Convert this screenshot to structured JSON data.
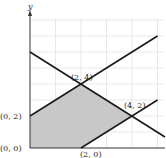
{
  "diagram": {
    "type": "feasible-region-graph",
    "axis": {
      "y_label": "y"
    },
    "x_range": [
      0,
      5.3
    ],
    "y_range": [
      0,
      8.2
    ],
    "grid_x": [
      1,
      2,
      3,
      4,
      5
    ],
    "grid_y": [
      1,
      2,
      3,
      4,
      5,
      6,
      7,
      8
    ],
    "lines": [
      {
        "name": "y = x + 2",
        "from": [
          0,
          2
        ],
        "to": [
          5,
          7
        ]
      },
      {
        "name": "y = -x + 6",
        "from": [
          0,
          6
        ],
        "to": [
          5.3,
          0.7
        ]
      },
      {
        "name": "y = x - 2",
        "from": [
          2,
          0
        ],
        "to": [
          5,
          3
        ]
      }
    ],
    "region": [
      [
        0,
        0
      ],
      [
        0,
        2
      ],
      [
        2,
        4
      ],
      [
        4,
        2
      ],
      [
        2,
        0
      ]
    ],
    "vertices": [
      {
        "label": "(0, 0)",
        "point": [
          0,
          0
        ]
      },
      {
        "label": "(0, 2)",
        "point": [
          0,
          2
        ]
      },
      {
        "label": "(2, 4)",
        "point": [
          2,
          4
        ]
      },
      {
        "label": "(4, 2)",
        "point": [
          4,
          2
        ]
      },
      {
        "label": "(2, 0)",
        "point": [
          2,
          0
        ]
      }
    ],
    "colors": {
      "region_fill": "#c8c8c8",
      "line": "#1a1a1a",
      "grid": "#e2e2e2",
      "axis": "#333333"
    }
  }
}
